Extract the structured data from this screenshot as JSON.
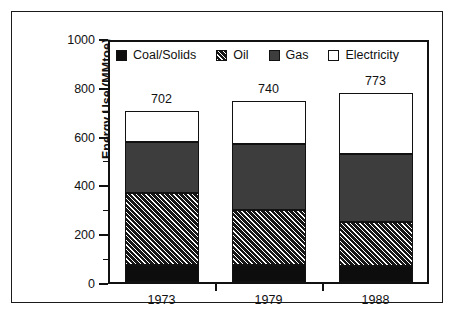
{
  "chart_data": {
    "type": "bar",
    "subtype": "stacked-vertical",
    "title": "",
    "xlabel": "",
    "ylabel": "Energy Use (MMtoe)",
    "categories": [
      "1973",
      "1979",
      "1988"
    ],
    "series": [
      {
        "name": "Coal/Solids",
        "values": [
          70,
          68,
          65
        ],
        "fill": "solid-black",
        "color": "#0d0d0d"
      },
      {
        "name": "Oil",
        "values": [
          295,
          228,
          180
        ],
        "fill": "diagonal-hatch",
        "color": "#161616"
      },
      {
        "name": "Gas",
        "values": [
          210,
          270,
          280
        ],
        "fill": "solid-gray",
        "color": "#3d3d3d"
      },
      {
        "name": "Electricity",
        "values": [
          127,
          174,
          248
        ],
        "fill": "solid-white",
        "color": "#ffffff"
      }
    ],
    "totals": [
      702,
      740,
      773
    ],
    "total_labels": [
      "702",
      "740",
      "773"
    ],
    "ylim": [
      0,
      1000
    ],
    "y_major_ticks": [
      0,
      200,
      400,
      600,
      800,
      1000
    ],
    "y_minor_ticks": [
      100,
      300,
      500,
      700,
      900
    ],
    "y_tick_labels": [
      "0",
      "200",
      "400",
      "600",
      "800",
      "1000"
    ],
    "grid": false,
    "legend_position": "top-inside"
  },
  "axes": {
    "y_title": "Energy Use (MMtoe)",
    "y_tick_labels": [
      "1000",
      "800",
      "600",
      "400",
      "200",
      "0"
    ],
    "x_tick_labels": [
      "1973",
      "1979",
      "1988"
    ]
  },
  "legend": {
    "items": [
      {
        "label": "Coal/Solids",
        "swatch": "solid-black-swatch"
      },
      {
        "label": "Oil",
        "swatch": "diagonal-hatch-swatch"
      },
      {
        "label": "Gas",
        "swatch": "solid-gray-swatch"
      },
      {
        "label": "Electricity",
        "swatch": "solid-white-swatch"
      }
    ]
  },
  "value_labels": [
    "702",
    "740",
    "773"
  ],
  "colors": {
    "coal": "#0d0d0d",
    "oil": "#161616",
    "gas": "#3d3d3d",
    "electricity": "#ffffff",
    "axis": "#111111",
    "frame": "#1a1a1a",
    "background": "#ffffff"
  }
}
